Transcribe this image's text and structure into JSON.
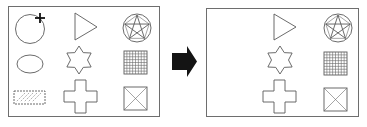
{
  "diagram": {
    "title": "",
    "panels": [
      {
        "id": "before",
        "label": "",
        "grid": [
          [
            "circle",
            "triangle",
            "pentagram-in-circle"
          ],
          [
            "ellipse",
            "six-pointed-star",
            "grid-square"
          ],
          [
            "hatched-rectangle",
            "cross",
            "x-box"
          ]
        ],
        "cursor": {
          "icon": "plus-cursor-icon",
          "on_shape": "circle"
        }
      },
      {
        "id": "after",
        "label": "",
        "grid": [
          [
            null,
            "triangle",
            "pentagram-in-circle"
          ],
          [
            null,
            "six-pointed-star",
            "grid-square"
          ],
          [
            null,
            "cross",
            "x-box"
          ]
        ]
      }
    ],
    "connector": {
      "icon": "right-arrow-icon",
      "from": "before",
      "to": "after"
    },
    "colors": {
      "stroke": "#5a5a5a",
      "frame": "#6e6e6e",
      "arrow": "#141414",
      "background": "#ffffff"
    }
  }
}
